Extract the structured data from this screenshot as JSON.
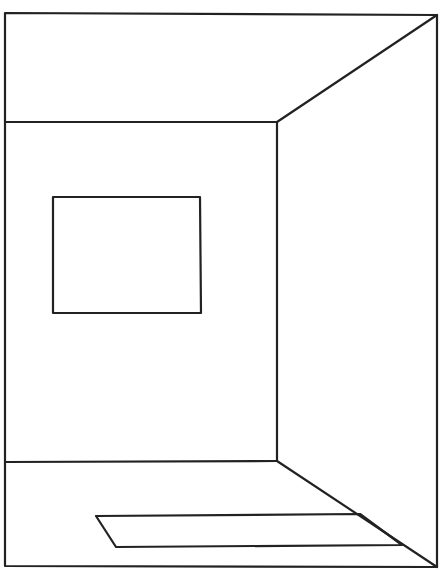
{
  "drawing": {
    "description": "Line drawing of a room interior in perspective with a window on the back wall and a rug on the floor",
    "stroke_color": "#222222",
    "background": "#ffffff",
    "outer_frame": [
      [
        5,
        13
      ],
      [
        437,
        15
      ],
      [
        437,
        567
      ],
      [
        5,
        566
      ]
    ],
    "back_wall": [
      [
        5,
        122
      ],
      [
        277,
        122
      ],
      [
        277,
        461
      ],
      [
        5,
        462
      ]
    ],
    "ceiling_edge": [
      [
        277,
        122
      ],
      [
        437,
        15
      ]
    ],
    "floor_edge": [
      [
        277,
        461
      ],
      [
        437,
        567
      ]
    ],
    "window": [
      [
        53,
        197
      ],
      [
        200,
        197
      ],
      [
        201,
        313
      ],
      [
        53,
        313
      ]
    ],
    "rug": [
      [
        96,
        516
      ],
      [
        360,
        514
      ],
      [
        402,
        545
      ],
      [
        116,
        547
      ]
    ]
  }
}
